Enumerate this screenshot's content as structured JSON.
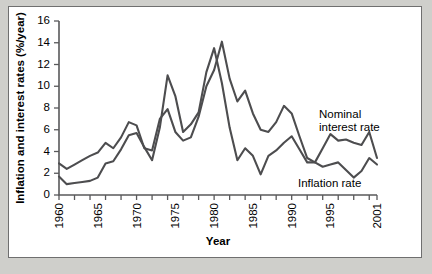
{
  "chart_data": {
    "type": "line",
    "title": "",
    "xlabel": "Year",
    "ylabel": "Inflation and interest rates (%/year)",
    "xlim": [
      1960,
      2001
    ],
    "ylim": [
      0,
      16
    ],
    "grid": false,
    "legend_position": "inline-right",
    "ytick_labels": [
      "0",
      "2",
      "4",
      "6",
      "8",
      "10",
      "12",
      "14",
      "16"
    ],
    "ytick_values": [
      0,
      2,
      4,
      6,
      8,
      10,
      12,
      14,
      16
    ],
    "xtick_labels": [
      "1960",
      "1965",
      "1970",
      "1975",
      "1980",
      "1985",
      "1990",
      "1995",
      "2001"
    ],
    "xtick_values": [
      1960,
      1965,
      1970,
      1975,
      1980,
      1985,
      1990,
      1995,
      2001
    ],
    "x": [
      1960,
      1961,
      1962,
      1963,
      1964,
      1965,
      1966,
      1967,
      1968,
      1969,
      1970,
      1971,
      1972,
      1973,
      1974,
      1975,
      1976,
      1977,
      1978,
      1979,
      1980,
      1981,
      1982,
      1983,
      1984,
      1985,
      1986,
      1987,
      1988,
      1989,
      1990,
      1991,
      1992,
      1993,
      1994,
      1995,
      1996,
      1997,
      1998,
      1999,
      2000,
      2001
    ],
    "series": [
      {
        "name": "Nominal interest rate",
        "label_lines": [
          "Nominal",
          "interest rate"
        ],
        "color": "#4d4d4f",
        "values": [
          2.9,
          2.4,
          2.8,
          3.2,
          3.6,
          3.9,
          4.8,
          4.3,
          5.3,
          6.7,
          6.4,
          4.3,
          4.1,
          7.0,
          7.9,
          5.8,
          5.0,
          5.3,
          7.2,
          10.0,
          11.5,
          14.1,
          10.7,
          8.6,
          9.6,
          7.5,
          6.0,
          5.8,
          6.7,
          8.2,
          7.5,
          5.4,
          3.4,
          3.0,
          4.3,
          5.6,
          5.0,
          5.1,
          4.8,
          4.6,
          5.8,
          3.4
        ],
        "annotation": "Nominal interest rate"
      },
      {
        "name": "Inflation rate",
        "label_lines": [
          "Inflation rate"
        ],
        "color": "#4d4d4f",
        "values": [
          1.7,
          1.0,
          1.1,
          1.2,
          1.3,
          1.6,
          2.9,
          3.1,
          4.2,
          5.5,
          5.7,
          4.4,
          3.2,
          6.2,
          11.0,
          9.1,
          5.8,
          6.5,
          7.6,
          11.3,
          13.5,
          10.3,
          6.2,
          3.2,
          4.3,
          3.6,
          1.9,
          3.6,
          4.1,
          4.8,
          5.4,
          4.2,
          3.0,
          3.0,
          2.6,
          2.8,
          3.0,
          2.3,
          1.6,
          2.2,
          3.4,
          2.8
        ],
        "annotation": "Inflation rate"
      }
    ],
    "annotations": [
      {
        "name": "nominal-label",
        "text_lines": [
          "Nominal",
          "interest rate"
        ]
      },
      {
        "name": "inflation-label",
        "text_lines": [
          "Inflation rate"
        ]
      }
    ]
  }
}
